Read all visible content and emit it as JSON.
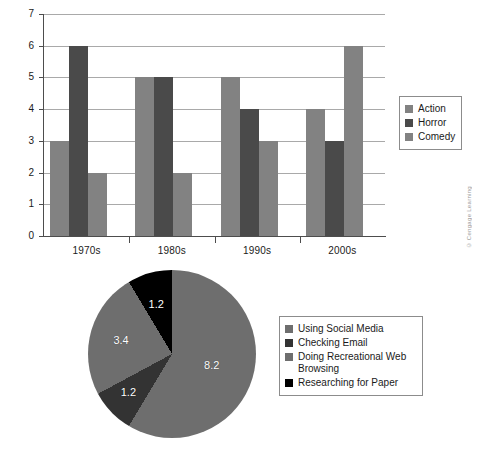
{
  "colors": {
    "action": "#828282",
    "horror": "#4a4a4a",
    "comedy": "#828282",
    "pie_gray": "#6e6e6e",
    "pie_dark": "#333333",
    "pie_mid_gray": "#6e6e6e",
    "pie_black": "#000000",
    "axis": "#4d4d4d",
    "grid": "#a9a9a9",
    "legend_border": "#8c8c8c",
    "background": "#ffffff",
    "label_text": "#1a1a1a",
    "credit_text": "#9a9a9a"
  },
  "bar_figure": {
    "credit": "© Cengage Learning",
    "legend": [
      {
        "label": "Action",
        "color": "#828282"
      },
      {
        "label": "Horror",
        "color": "#4a4a4a"
      },
      {
        "label": "Comedy",
        "color": "#828282"
      }
    ]
  },
  "pie_figure": {
    "credit": "© Cengage Learning",
    "legend": [
      {
        "label": "Using Social Media",
        "color": "#6e6e6e"
      },
      {
        "label": "Checking Email",
        "color": "#333333"
      },
      {
        "label": "Doing Recreational Web Browsing",
        "color": "#6e6e6e"
      },
      {
        "label": "Researching for Paper",
        "color": "#000000"
      }
    ]
  },
  "chart_data": [
    {
      "type": "bar",
      "title": "",
      "xlabel": "",
      "ylabel": "",
      "categories": [
        "1970s",
        "1980s",
        "1990s",
        "2000s"
      ],
      "series": [
        {
          "name": "Action",
          "color": "#828282",
          "values": [
            3,
            5,
            5,
            4
          ]
        },
        {
          "name": "Horror",
          "color": "#4a4a4a",
          "values": [
            6,
            5,
            4,
            3
          ]
        },
        {
          "name": "Comedy",
          "color": "#828282",
          "values": [
            2,
            2,
            3,
            6
          ]
        }
      ],
      "ylim": [
        0,
        7
      ],
      "yticks": [
        0,
        1,
        2,
        3,
        4,
        5,
        6,
        7
      ],
      "ytick_labels": [
        "0",
        "1",
        "2",
        "3",
        "4",
        "5",
        "6",
        "7"
      ],
      "grid": true,
      "legend_position": "right"
    },
    {
      "type": "pie",
      "title": "",
      "labels": [
        "Using Social Media",
        "Checking Email",
        "Doing Recreational Web Browsing",
        "Researching for Paper"
      ],
      "values": [
        8.2,
        1.2,
        3.4,
        1.2
      ],
      "value_labels": [
        "8.2",
        "1.2",
        "3.4",
        "1.2"
      ],
      "colors": [
        "#6e6e6e",
        "#333333",
        "#6e6e6e",
        "#000000"
      ],
      "total": 14.0,
      "legend_position": "right"
    }
  ]
}
